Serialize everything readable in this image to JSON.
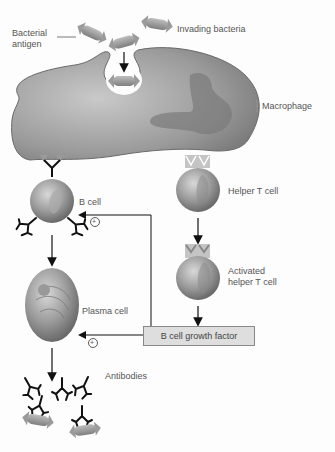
{
  "diagram": {
    "labels": {
      "bacterial_antigen": "Bacterial\nantigen",
      "bacterial_antigen_line1": "Bacterial",
      "bacterial_antigen_line2": "antigen",
      "invading_bacteria": "Invading bacteria",
      "macrophage": "Macrophage",
      "b_cell": "B cell",
      "helper_t_cell": "Helper T cell",
      "activated_helper_t_cell_line1": "Activated",
      "activated_helper_t_cell_line2": "helper T cell",
      "plasma_cell": "Plasma cell",
      "b_cell_growth_factor": "B cell growth factor",
      "antibodies": "Antibodies",
      "plus_marker": "+"
    },
    "flow": [
      "Invading bacteria -> engulfed by Macrophage",
      "Macrophage presents antigen -> B cell",
      "Macrophage presents antigen -> Helper T cell",
      "Helper T cell -> Activated helper T cell",
      "Activated helper T cell -> B cell growth factor",
      "B cell growth factor -> B cell (+)",
      "B cell growth factor -> Plasma cell (+)",
      "B cell -> Plasma cell",
      "Plasma cell -> Antibodies"
    ]
  }
}
